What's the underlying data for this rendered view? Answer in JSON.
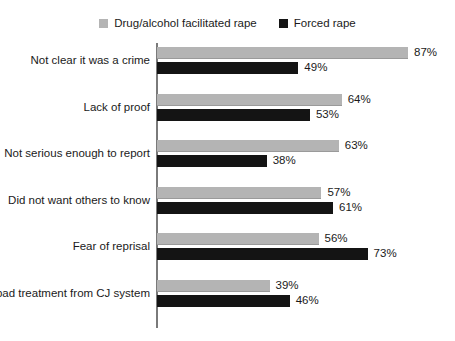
{
  "legend": {
    "entries": [
      {
        "label": "Drug/alcohol facilitated rape",
        "color": "#b4b4b4",
        "swatch_name": "legend-swatch-drug-alcohol"
      },
      {
        "label": "Forced rape",
        "color": "#141414",
        "swatch_name": "legend-swatch-forced"
      }
    ]
  },
  "chart_data": {
    "type": "bar",
    "orientation": "horizontal",
    "title": "",
    "subtitle": "",
    "xlabel": "",
    "ylabel": "",
    "xlim": [
      0,
      100
    ],
    "grid": false,
    "legend_position": "top-center",
    "value_suffix": "%",
    "categories": [
      "Not clear it was a crime",
      "Lack of proof",
      "Not serious enough to report",
      "Did not want others to know",
      "Fear of reprisal",
      "Fear bad treatment from CJ system"
    ],
    "series": [
      {
        "name": "Drug/alcohol facilitated rape",
        "color": "#b4b4b4",
        "values": [
          87,
          64,
          63,
          57,
          56,
          39
        ],
        "labels": [
          "87%",
          "64%",
          "63%",
          "57%",
          "56%",
          "39%"
        ]
      },
      {
        "name": "Forced rape",
        "color": "#141414",
        "values": [
          49,
          53,
          38,
          61,
          73,
          46
        ],
        "labels": [
          "49%",
          "53%",
          "38%",
          "61%",
          "73%",
          "46%"
        ]
      }
    ]
  },
  "scale": {
    "px_per_percent": 2.885
  }
}
